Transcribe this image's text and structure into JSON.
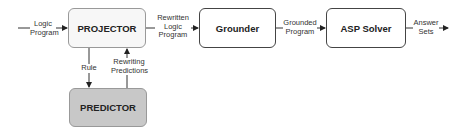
{
  "nodes": {
    "projector": {
      "label": "PROJECTOR",
      "fill": "#f7f7f7"
    },
    "grounder": {
      "label": "Grounder",
      "fill": "#ffffff"
    },
    "asp_solver": {
      "label": "ASP Solver",
      "fill": "#ffffff"
    },
    "predictor": {
      "label": "PREDICTOR",
      "fill": "#c8c8c8"
    }
  },
  "edges": {
    "input": {
      "line1": "Logic",
      "line2": "Program"
    },
    "projector_to_grounder": {
      "line1": "Rewritten",
      "line2": "Logic",
      "line3": "Program"
    },
    "grounder_to_solver": {
      "line1": "Grounded",
      "line2": "Program"
    },
    "output": {
      "line1": "Answer",
      "line2": "Sets"
    },
    "rule": {
      "label": "Rule"
    },
    "rewriting_predictions": {
      "line1": "Rewriting",
      "line2": "Predictions"
    }
  }
}
